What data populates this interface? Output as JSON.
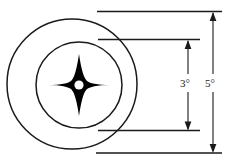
{
  "figure": {
    "type": "technical-dimension-diagram",
    "background_color": "#ffffff",
    "line_color": "#1a1a1a",
    "fill_color": "#000000"
  },
  "shapes": {
    "outer_circle": {
      "name": "outer-circle",
      "cx": 72,
      "cy": 84,
      "r": 65,
      "stroke_width": 1.4,
      "fill": "none"
    },
    "inner_circle": {
      "name": "inner-circle",
      "cx": 79,
      "cy": 85,
      "r": 43,
      "stroke_width": 1.4,
      "fill": "none"
    },
    "star": {
      "name": "four-pointed-star",
      "cx": 79,
      "cy": 85,
      "point_radius": 31,
      "waist_radius": 9,
      "fill": "#000000"
    },
    "center_hole": {
      "name": "center-hole",
      "cx": 79,
      "cy": 85,
      "r": 4.5,
      "fill": "#ffffff"
    }
  },
  "dimensions": {
    "inner": {
      "label": "3°",
      "value": 3,
      "unit": "degrees",
      "axis_x": 188,
      "top_y": 40,
      "bottom_y": 131,
      "extension_top_y": 40,
      "extension_bottom_y": 131,
      "extension_x_start": 98,
      "extension_x_end": 200
    },
    "outer": {
      "label": "5°",
      "value": 5,
      "unit": "degrees",
      "axis_x": 213,
      "top_y": 12,
      "bottom_y": 153,
      "extension_top_y": 12,
      "extension_bottom_y": 153,
      "extension_x_start": 97,
      "extension_x_end": 222
    }
  }
}
